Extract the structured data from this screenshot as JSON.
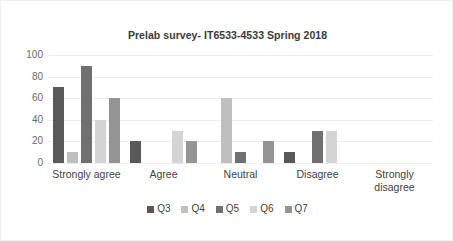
{
  "chart_data": {
    "type": "bar",
    "title": "Prelab survey- IT6533-4533 Spring 2018",
    "xlabel": "",
    "ylabel": "",
    "ylim": [
      0,
      100
    ],
    "yticks": [
      0,
      20,
      40,
      60,
      80,
      100
    ],
    "grid": true,
    "legend_position": "bottom",
    "categories": [
      "Strongly agree",
      "Agree",
      "Neutral",
      "Disagree",
      "Strongly disagree"
    ],
    "series": [
      {
        "name": "Q3",
        "color": "#595959",
        "values": [
          70,
          20,
          0,
          10,
          0
        ]
      },
      {
        "name": "Q4",
        "color": "#bfbfbf",
        "values": [
          10,
          0,
          60,
          0,
          0
        ]
      },
      {
        "name": "Q5",
        "color": "#707070",
        "values": [
          90,
          0,
          10,
          30,
          0
        ]
      },
      {
        "name": "Q6",
        "color": "#d4d4d4",
        "values": [
          40,
          30,
          0,
          30,
          0
        ]
      },
      {
        "name": "Q7",
        "color": "#949494",
        "values": [
          60,
          20,
          20,
          0,
          0
        ]
      }
    ]
  }
}
